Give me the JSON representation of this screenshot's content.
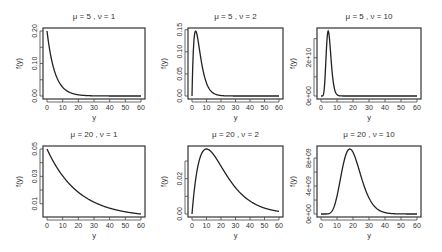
{
  "chart_data": [
    {
      "type": "line",
      "title": "μ = 5 , ν = 1",
      "mu": 5,
      "nu": 1,
      "xlabel": "y",
      "ylabel": "f(y)",
      "xlim": [
        0,
        60
      ],
      "ylim": [
        0,
        0.2
      ],
      "xticks": [
        0,
        10,
        20,
        30,
        40,
        50,
        60
      ],
      "xtick_labels": [
        "0",
        "10",
        "20",
        "30",
        "40",
        "50",
        "60"
      ],
      "yticks": [
        0,
        0.05,
        0.1,
        0.15,
        0.2
      ],
      "ytick_labels": [
        "0.00",
        "",
        "0.10",
        "",
        "0.20"
      ],
      "series": [
        {
          "name": "density",
          "x_range": [
            0,
            60
          ],
          "peak_y": 0.2,
          "peak_x": 0
        }
      ]
    },
    {
      "type": "line",
      "title": "μ = 5 , ν = 2",
      "mu": 5,
      "nu": 2,
      "xlabel": "y",
      "ylabel": "f(y)",
      "xlim": [
        0,
        60
      ],
      "ylim": [
        0,
        0.147
      ],
      "xticks": [
        0,
        10,
        20,
        30,
        40,
        50,
        60
      ],
      "xtick_labels": [
        "0",
        "10",
        "20",
        "30",
        "40",
        "50",
        "60"
      ],
      "yticks": [
        0,
        0.05,
        0.1,
        0.15
      ],
      "ytick_labels": [
        "0.00",
        "0.05",
        "0.10",
        "0.15"
      ],
      "series": [
        {
          "name": "density",
          "x_range": [
            0,
            60
          ],
          "peak_y": 0.147,
          "peak_x": 2.5
        }
      ]
    },
    {
      "type": "line",
      "title": "μ = 5 , ν = 10",
      "mu": 5,
      "nu": 10,
      "xlabel": "y",
      "ylabel": "f(y)",
      "xlim": [
        0,
        60
      ],
      "ylim": [
        0,
        34000000000.0
      ],
      "xticks": [
        0,
        10,
        20,
        30,
        40,
        50,
        60
      ],
      "xtick_labels": [
        "0",
        "10",
        "20",
        "30",
        "40",
        "50",
        "60"
      ],
      "yticks": [
        0,
        10000000000.0,
        20000000000.0,
        30000000000.0
      ],
      "ytick_labels": [
        "0e+00",
        "",
        "2e+10",
        ""
      ],
      "series": [
        {
          "name": "density",
          "x_range": [
            0,
            60
          ],
          "peak_y": 34000000000.0,
          "peak_x": 4.5
        }
      ]
    },
    {
      "type": "line",
      "title": "μ = 20 , ν = 1",
      "mu": 20,
      "nu": 1,
      "xlabel": "y",
      "ylabel": "f(y)",
      "xlim": [
        0,
        60
      ],
      "ylim": [
        0.0025,
        0.05
      ],
      "xticks": [
        0,
        10,
        20,
        30,
        40,
        50,
        60
      ],
      "xtick_labels": [
        "0",
        "10",
        "20",
        "30",
        "40",
        "50",
        "60"
      ],
      "yticks": [
        0.01,
        0.02,
        0.03,
        0.04,
        0.05
      ],
      "ytick_labels": [
        "0.01",
        "",
        "0.03",
        "",
        "0.05"
      ],
      "series": [
        {
          "name": "density",
          "x_range": [
            0,
            60
          ],
          "peak_y": 0.05,
          "peak_x": 0
        }
      ]
    },
    {
      "type": "line",
      "title": "μ = 20 , ν = 2",
      "mu": 20,
      "nu": 2,
      "xlabel": "y",
      "ylabel": "f(y)",
      "xlim": [
        0,
        60
      ],
      "ylim": [
        0,
        0.0368
      ],
      "xticks": [
        0,
        10,
        20,
        30,
        40,
        50,
        60
      ],
      "xtick_labels": [
        "0",
        "10",
        "20",
        "30",
        "40",
        "50",
        "60"
      ],
      "yticks": [
        0,
        0.01,
        0.02,
        0.03,
        0.04
      ],
      "ytick_labels": [
        "0.00",
        "",
        "0.02",
        "",
        "0.04"
      ],
      "series": [
        {
          "name": "density",
          "x_range": [
            0,
            60
          ],
          "peak_y": 0.0368,
          "peak_x": 10
        }
      ]
    },
    {
      "type": "line",
      "title": "μ = 20 , ν = 10",
      "mu": 20,
      "nu": 10,
      "xlabel": "y",
      "ylabel": "f(y)",
      "xlim": [
        0,
        60
      ],
      "ylim": [
        0,
        9300000000.0
      ],
      "xticks": [
        0,
        10,
        20,
        30,
        40,
        50,
        60
      ],
      "xtick_labels": [
        "0",
        "10",
        "20",
        "30",
        "40",
        "50",
        "60"
      ],
      "yticks": [
        0,
        2000000000.0,
        4000000000.0,
        6000000000.0,
        8000000000.0
      ],
      "ytick_labels": [
        "0e+00",
        "",
        "4e+09",
        "",
        "8e+09"
      ],
      "series": [
        {
          "name": "density",
          "x_range": [
            0,
            60
          ],
          "peak_y": 9300000000.0,
          "peak_x": 18
        }
      ]
    }
  ]
}
